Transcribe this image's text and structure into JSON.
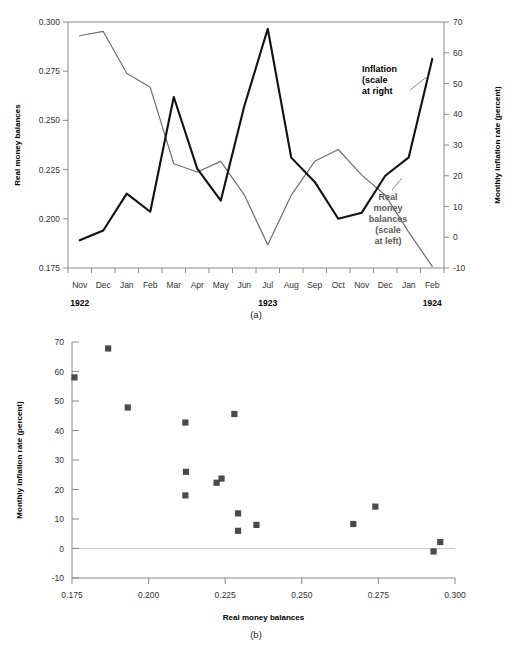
{
  "figure": {
    "panel_a_caption": "(a)",
    "panel_b_caption": "(b)"
  },
  "chart_data": [
    {
      "type": "line",
      "panel": "(a)",
      "title": "",
      "xlabel": "",
      "grid": false,
      "legend_position": "inline-annotation",
      "x": [
        "Nov",
        "Dec",
        "Jan",
        "Feb",
        "Mar",
        "Apr",
        "May",
        "Jun",
        "Jul",
        "Aug",
        "Sep",
        "Oct",
        "Nov",
        "Dec",
        "Jan",
        "Feb"
      ],
      "x_year_labels": [
        {
          "label": "1922",
          "at": "Nov"
        },
        {
          "label": "1923",
          "at": "Jul"
        },
        {
          "label": "1924",
          "at": "Feb"
        }
      ],
      "left_axis": {
        "label": "Real money balances",
        "ylim": [
          0.175,
          0.3
        ],
        "ticks": [
          0.175,
          0.2,
          0.225,
          0.25,
          0.275,
          0.3
        ],
        "ticklabels": [
          "0.175",
          "0.200",
          "0.225",
          "0.250",
          "0.275",
          "0.300"
        ]
      },
      "right_axis": {
        "label": "Monthly inflation rate (percent)",
        "ylim": [
          -10,
          70
        ],
        "ticks": [
          -10,
          0,
          10,
          20,
          30,
          40,
          50,
          60,
          70
        ],
        "ticklabels": [
          "-10",
          "0",
          "10",
          "20",
          "30",
          "40",
          "50",
          "60",
          "70"
        ]
      },
      "series": [
        {
          "name": "Real money balances (scale at left)",
          "axis": "left",
          "color": "#6e6e6e",
          "values": [
            0.293,
            0.2952,
            0.274,
            0.2668,
            0.228,
            0.2238,
            0.2292,
            0.2122,
            0.1868,
            0.212,
            0.2292,
            0.2352,
            0.2222,
            0.212,
            0.1932,
            0.1758
          ]
        },
        {
          "name": "Inflation (scale at right",
          "axis": "right",
          "color": "#111111",
          "values": [
            -1.0,
            2.2,
            14.2,
            8.3,
            45.6,
            22.3,
            11.9,
            42.6,
            67.8,
            25.9,
            18.0,
            6.0,
            8.0,
            20.0,
            26.0,
            58.0
          ]
        }
      ],
      "annotations": [
        {
          "text": "Inflation\n(scale\nat right",
          "for": "inflation",
          "color": "#000000"
        },
        {
          "text": "Real\nmoney\nbalances\n(scale\nat left)",
          "for": "real money balances",
          "color": "#5a5a5a"
        }
      ]
    },
    {
      "type": "scatter",
      "panel": "(b)",
      "title": "",
      "xlabel": "Real money balances",
      "ylabel": "Monthly inflation rate (percent)",
      "grid": false,
      "xlim": [
        0.175,
        0.3
      ],
      "ylim": [
        -10,
        70
      ],
      "xticks": [
        0.175,
        0.2,
        0.225,
        0.25,
        0.275,
        0.3
      ],
      "xticklabels": [
        "0.175",
        "0.200",
        "0.225",
        "0.250",
        "0.275",
        "0.300"
      ],
      "yticks": [
        -10,
        0,
        10,
        20,
        30,
        40,
        50,
        60,
        70
      ],
      "yticklabels": [
        "-10",
        "0",
        "10",
        "20",
        "30",
        "40",
        "50",
        "60",
        "70"
      ],
      "marker": "square",
      "marker_color": "#4a4a4a",
      "points": [
        {
          "x": 0.1758,
          "y": 58.0,
          "label": "Feb 1924"
        },
        {
          "x": 0.1868,
          "y": 67.8,
          "label": "Jul 1923"
        },
        {
          "x": 0.1932,
          "y": 47.8,
          "label": "Jan 1924"
        },
        {
          "x": 0.212,
          "y": 42.7,
          "label": "Jun 1923"
        },
        {
          "x": 0.2122,
          "y": 26.0,
          "label": "Aug 1923"
        },
        {
          "x": 0.212,
          "y": 18.0,
          "label": "Dec 1923"
        },
        {
          "x": 0.2222,
          "y": 22.3,
          "label": "Apr 1923"
        },
        {
          "x": 0.2238,
          "y": 23.7,
          "label": "Jan 1924"
        },
        {
          "x": 0.228,
          "y": 45.6,
          "label": "Mar 1923"
        },
        {
          "x": 0.2292,
          "y": 11.9,
          "label": "May 1923"
        },
        {
          "x": 0.2292,
          "y": 6.0,
          "label": "Sep 1923"
        },
        {
          "x": 0.2352,
          "y": 8.0,
          "label": "Oct 1923"
        },
        {
          "x": 0.2668,
          "y": 8.3,
          "label": "Feb 1923"
        },
        {
          "x": 0.274,
          "y": 14.2,
          "label": "Jan 1923"
        },
        {
          "x": 0.293,
          "y": -1.0,
          "label": "Nov 1922"
        },
        {
          "x": 0.2952,
          "y": 2.2,
          "label": "Dec 1922"
        }
      ]
    }
  ]
}
